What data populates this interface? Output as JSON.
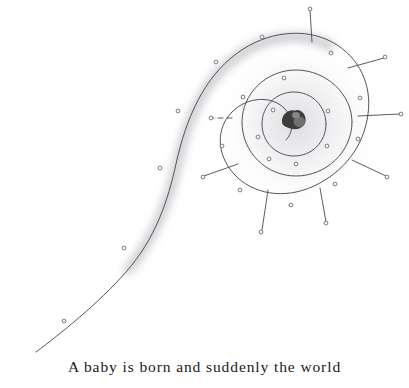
{
  "page": {
    "width": 409,
    "height": 388,
    "background_color": "#ffffff",
    "kind": "book-illustration-with-caption"
  },
  "caption": {
    "text": "A baby is born and suddenly the world",
    "color": "#1a1a1a",
    "align": "center"
  },
  "artwork": {
    "title": "spiral-with-radiating-rays",
    "ink_color": "#4a4a52",
    "shadow_color": "#b9b9bf",
    "blob_color": "#3c3c3c",
    "dot_stroke_color": "#6b6b72",
    "center": {
      "x": 296,
      "y": 122
    },
    "spiral_path": "M 36 352 C 60 334 98 304 126 272 C 156 238 168 200 176 164 C 186 118 204 78 236 54 C 268 30 306 28 332 42 C 360 57 372 86 368 114 C 364 146 344 172 314 186 C 284 200 252 194 234 174 C 216 154 216 128 232 112 C 248 96 272 96 284 108 C 294 118 294 132 286 140",
    "inner_ring_path": "M 352 122 C 352 152 326 176 296 176 C 266 176 242 152 242 122 C 242 94 266 70 296 70 C 326 70 352 94 352 122",
    "core_ring_path": "M 326 124 C 326 142 312 156 294 156 C 276 156 262 142 262 124 C 262 106 276 92 294 92 C 312 92 326 106 326 124",
    "shadow_path": "M 128 270 C 156 236 170 198 178 162 C 188 116 206 78 238 56 C 268 34 304 32 330 46",
    "blob": {
      "x": 294,
      "y": 120,
      "width": 24,
      "height": 18
    },
    "rays": [
      {
        "x1": 312,
        "y1": 42,
        "x2": 310,
        "y2": 10,
        "dashed": false
      },
      {
        "x1": 348,
        "y1": 68,
        "x2": 384,
        "y2": 58,
        "dashed": false
      },
      {
        "x1": 358,
        "y1": 116,
        "x2": 400,
        "y2": 114,
        "dashed": false
      },
      {
        "x1": 352,
        "y1": 160,
        "x2": 386,
        "y2": 176,
        "dashed": false
      },
      {
        "x1": 320,
        "y1": 188,
        "x2": 326,
        "y2": 222,
        "dashed": false
      },
      {
        "x1": 268,
        "y1": 190,
        "x2": 262,
        "y2": 230,
        "dashed": false
      },
      {
        "x1": 238,
        "y1": 164,
        "x2": 204,
        "y2": 176,
        "dashed": false
      },
      {
        "x1": 232,
        "y1": 118,
        "x2": 212,
        "y2": 118,
        "dashed": true
      }
    ],
    "ray_tip_dots": [
      {
        "x": 310,
        "y": 9
      },
      {
        "x": 385,
        "y": 57
      },
      {
        "x": 401,
        "y": 114
      },
      {
        "x": 387,
        "y": 177
      },
      {
        "x": 326,
        "y": 223
      },
      {
        "x": 261,
        "y": 232
      },
      {
        "x": 203,
        "y": 177
      },
      {
        "x": 211,
        "y": 118
      }
    ],
    "scatter_dots": [
      {
        "x": 262,
        "y": 37
      },
      {
        "x": 216,
        "y": 62
      },
      {
        "x": 331,
        "y": 53
      },
      {
        "x": 284,
        "y": 78
      },
      {
        "x": 243,
        "y": 97
      },
      {
        "x": 360,
        "y": 98
      },
      {
        "x": 328,
        "y": 111
      },
      {
        "x": 273,
        "y": 110
      },
      {
        "x": 178,
        "y": 111
      },
      {
        "x": 258,
        "y": 137
      },
      {
        "x": 327,
        "y": 146
      },
      {
        "x": 358,
        "y": 139
      },
      {
        "x": 222,
        "y": 146
      },
      {
        "x": 269,
        "y": 159
      },
      {
        "x": 296,
        "y": 164
      },
      {
        "x": 160,
        "y": 168
      },
      {
        "x": 240,
        "y": 190
      },
      {
        "x": 335,
        "y": 184
      },
      {
        "x": 291,
        "y": 205
      },
      {
        "x": 124,
        "y": 248
      },
      {
        "x": 64,
        "y": 321
      }
    ]
  }
}
